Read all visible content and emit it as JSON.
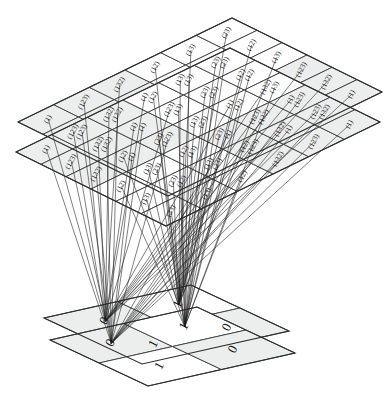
{
  "figure": {
    "type": "commutative-mapping-diagram",
    "background_color": "#ffffff",
    "line_color": "#1f1f1f",
    "cell_fill_light": "#eceded",
    "cell_fill_white": "#ffffff",
    "border_color": "#2e2e2e"
  },
  "source_structure": {
    "name": "S3",
    "order": 6,
    "elements": [
      "(1)",
      "(123)",
      "(132)",
      "(12)",
      "(13)",
      "(23)"
    ],
    "grid_rows": 6,
    "grid_cols": 6,
    "plane_count": 2,
    "plane_labels": [
      "upper-cayley-plane",
      "lower-cayley-plane"
    ],
    "cayley_table": [
      [
        "(1)",
        "(123)",
        "(132)",
        "(12)",
        "(13)",
        "(23)"
      ],
      [
        "(123)",
        "(132)",
        "(1)",
        "(13)",
        "(23)",
        "(12)"
      ],
      [
        "(132)",
        "(1)",
        "(123)",
        "(23)",
        "(12)",
        "(13)"
      ],
      [
        "(12)",
        "(23)",
        "(13)",
        "(1)",
        "(132)",
        "(123)"
      ],
      [
        "(13)",
        "(12)",
        "(23)",
        "(123)",
        "(1)",
        "(132)"
      ],
      [
        "(23)",
        "(13)",
        "(12)",
        "(132)",
        "(123)",
        "(1)"
      ]
    ],
    "shaded_cells": [
      [
        true,
        true,
        true,
        false,
        false,
        false
      ],
      [
        true,
        true,
        true,
        false,
        false,
        false
      ],
      [
        true,
        true,
        true,
        false,
        false,
        false
      ],
      [
        false,
        false,
        false,
        true,
        true,
        true
      ],
      [
        false,
        false,
        false,
        true,
        true,
        true
      ],
      [
        false,
        false,
        false,
        true,
        true,
        true
      ]
    ]
  },
  "target_structure": {
    "name": "Z2",
    "order": 2,
    "elements": [
      "0",
      "1"
    ],
    "grid_rows": 2,
    "grid_cols": 2,
    "plane_count": 2,
    "cayley_table": [
      [
        "0",
        "1"
      ],
      [
        "1",
        "0"
      ]
    ],
    "shaded_cells": [
      [
        true,
        false
      ],
      [
        false,
        true
      ]
    ]
  },
  "mapping": {
    "name": "sign-homomorphism",
    "description": "even permutations map to 0, odd permutations map to 1",
    "even_to": "0",
    "odd_to": "1",
    "even_elements": [
      "(1)",
      "(123)",
      "(132)"
    ],
    "odd_elements": [
      "(12)",
      "(13)",
      "(23)"
    ]
  }
}
